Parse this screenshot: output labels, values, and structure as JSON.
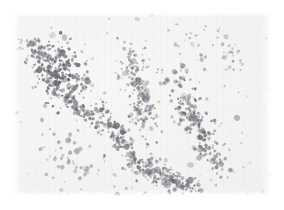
{
  "image": {
    "kind": "scanned-particle-micrograph",
    "description": "Scanned grayscale plate showing scattered dark particulate specks forming filamentary clusters on a near-white paper background",
    "width_px": 284,
    "height_px": 210,
    "background_color": "#ffffff",
    "plate_color": "#f3f3f1",
    "particle_color": "#7a7a86",
    "particle_color_dark": "#5d5d6b",
    "particle_color_light": "#b9b9c2",
    "plate": {
      "x": 13,
      "y": 12,
      "width": 258,
      "height": 184
    },
    "margins": {
      "top": 12,
      "right": 13,
      "bottom": 14,
      "left": 13
    }
  },
  "chart_data": {
    "type": "scatter",
    "title": "",
    "subtitle": "",
    "xlabel": "",
    "ylabel": "",
    "xlim": [
      0,
      258
    ],
    "ylim": [
      0,
      184
    ],
    "grid": false,
    "legend": null,
    "annotations": [],
    "tick_labels": {
      "x": [],
      "y": []
    },
    "point_color": "#7a7a86",
    "point_count_approx": 980,
    "clusters": [
      {
        "name": "upper-left-dense-knot",
        "cx": 46,
        "cy": 62,
        "rx": 26,
        "ry": 30,
        "n": 200,
        "density": "high",
        "darkness": 0.92,
        "elongation": 1.25,
        "angle_deg": 55
      },
      {
        "name": "upper-left-arc",
        "cx": 34,
        "cy": 40,
        "rx": 18,
        "ry": 16,
        "n": 70,
        "density": "medium",
        "darkness": 0.7,
        "elongation": 1.4,
        "angle_deg": 30
      },
      {
        "name": "left-descending-tail",
        "cx": 68,
        "cy": 98,
        "rx": 22,
        "ry": 16,
        "n": 80,
        "density": "medium",
        "darkness": 0.72,
        "elongation": 2.0,
        "angle_deg": 35
      },
      {
        "name": "central-diagonal-filament",
        "cx": 104,
        "cy": 122,
        "rx": 26,
        "ry": 20,
        "n": 95,
        "density": "medium",
        "darkness": 0.75,
        "elongation": 2.2,
        "angle_deg": 55
      },
      {
        "name": "mid-upper-stream",
        "cx": 122,
        "cy": 60,
        "rx": 18,
        "ry": 24,
        "n": 70,
        "density": "medium",
        "darkness": 0.62,
        "elongation": 1.8,
        "angle_deg": 75
      },
      {
        "name": "mid-vertical-chain",
        "cx": 130,
        "cy": 100,
        "rx": 16,
        "ry": 28,
        "n": 80,
        "density": "medium",
        "darkness": 0.66,
        "elongation": 1.9,
        "angle_deg": 80
      },
      {
        "name": "right-diagonal-chain",
        "cx": 176,
        "cy": 96,
        "rx": 18,
        "ry": 34,
        "n": 110,
        "density": "high",
        "darkness": 0.8,
        "elongation": 2.4,
        "angle_deg": 62
      },
      {
        "name": "right-lower-arc",
        "cx": 196,
        "cy": 140,
        "rx": 16,
        "ry": 20,
        "n": 60,
        "density": "medium",
        "darkness": 0.66,
        "elongation": 1.7,
        "angle_deg": 60
      },
      {
        "name": "bottom-center-cluster",
        "cx": 142,
        "cy": 158,
        "rx": 24,
        "ry": 18,
        "n": 85,
        "density": "medium",
        "darkness": 0.72,
        "elongation": 1.6,
        "angle_deg": 20
      },
      {
        "name": "bottom-right-knot",
        "cx": 166,
        "cy": 172,
        "rx": 18,
        "ry": 12,
        "n": 55,
        "density": "medium",
        "darkness": 0.74,
        "elongation": 1.5,
        "angle_deg": 10
      },
      {
        "name": "lower-left-sparse",
        "cx": 58,
        "cy": 150,
        "rx": 26,
        "ry": 22,
        "n": 35,
        "density": "low",
        "darkness": 0.5,
        "elongation": 1.2,
        "angle_deg": 40
      },
      {
        "name": "upper-right-sparse",
        "cx": 206,
        "cy": 38,
        "rx": 34,
        "ry": 24,
        "n": 30,
        "density": "low",
        "darkness": 0.48,
        "elongation": 1.3,
        "angle_deg": 15
      }
    ],
    "scatter_background_points": 130
  }
}
